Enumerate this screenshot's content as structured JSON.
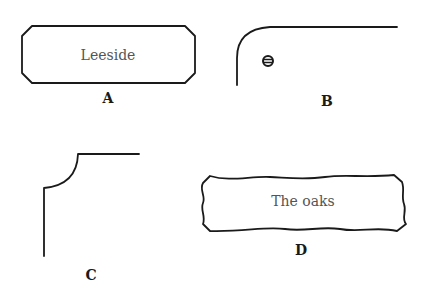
{
  "figures": [
    {
      "id": "A",
      "label": "A",
      "sign_text": "Leeside",
      "shape": "chamfered-rectangle"
    },
    {
      "id": "B",
      "label": "B",
      "shape": "rounded-corner-with-screw"
    },
    {
      "id": "C",
      "label": "C",
      "shape": "concave-corner"
    },
    {
      "id": "D",
      "label": "D",
      "sign_text": "The oaks",
      "shape": "wavy-edged-plaque"
    }
  ],
  "colors": {
    "stroke": "#1a1a1a",
    "sign_text": "#555555",
    "background": "#ffffff"
  }
}
